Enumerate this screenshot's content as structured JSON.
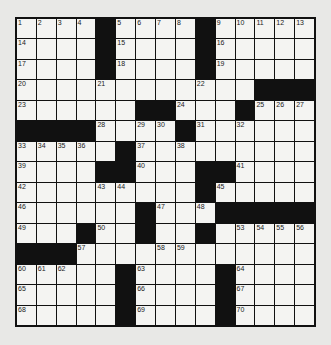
{
  "puzzle": {
    "rows": 15,
    "cols": 15,
    "colors": {
      "black": "#111111",
      "white": "#f4f4f2",
      "background": "#e8e8e6"
    },
    "grid": [
      "....#....#.....",
      "....#....#.....",
      "....#....#.....",
      "............###",
      "......##...#...",
      "####....#......",
      ".....#.........",
      "....##...##....",
      ".........#.....",
      "......#...#####",
      "...#..#..#.....",
      "###............",
      ".....#....#....",
      ".....#....#....",
      ".....#....#...."
    ],
    "numbers": [
      {
        "r": 0,
        "c": 0,
        "n": "1"
      },
      {
        "r": 0,
        "c": 1,
        "n": "2"
      },
      {
        "r": 0,
        "c": 2,
        "n": "3"
      },
      {
        "r": 0,
        "c": 3,
        "n": "4"
      },
      {
        "r": 0,
        "c": 5,
        "n": "5"
      },
      {
        "r": 0,
        "c": 6,
        "n": "6"
      },
      {
        "r": 0,
        "c": 7,
        "n": "7"
      },
      {
        "r": 0,
        "c": 8,
        "n": "8"
      },
      {
        "r": 0,
        "c": 10,
        "n": "9"
      },
      {
        "r": 0,
        "c": 11,
        "n": "10"
      },
      {
        "r": 0,
        "c": 12,
        "n": "11"
      },
      {
        "r": 0,
        "c": 13,
        "n": "12"
      },
      {
        "r": 0,
        "c": 14,
        "n": "13"
      },
      {
        "r": 1,
        "c": 0,
        "n": "14"
      },
      {
        "r": 1,
        "c": 5,
        "n": "15"
      },
      {
        "r": 1,
        "c": 10,
        "n": "16"
      },
      {
        "r": 2,
        "c": 0,
        "n": "17"
      },
      {
        "r": 2,
        "c": 5,
        "n": "18"
      },
      {
        "r": 2,
        "c": 10,
        "n": "19"
      },
      {
        "r": 3,
        "c": 0,
        "n": "20"
      },
      {
        "r": 3,
        "c": 4,
        "n": "21"
      },
      {
        "r": 3,
        "c": 9,
        "n": "22"
      },
      {
        "r": 4,
        "c": 0,
        "n": "23"
      },
      {
        "r": 4,
        "c": 8,
        "n": "24"
      },
      {
        "r": 4,
        "c": 12,
        "n": "25"
      },
      {
        "r": 4,
        "c": 13,
        "n": "26"
      },
      {
        "r": 4,
        "c": 14,
        "n": "27"
      },
      {
        "r": 5,
        "c": 4,
        "n": "28"
      },
      {
        "r": 5,
        "c": 6,
        "n": "29"
      },
      {
        "r": 5,
        "c": 7,
        "n": "30"
      },
      {
        "r": 5,
        "c": 9,
        "n": "31"
      },
      {
        "r": 5,
        "c": 11,
        "n": "32"
      },
      {
        "r": 6,
        "c": 0,
        "n": "33"
      },
      {
        "r": 6,
        "c": 1,
        "n": "34"
      },
      {
        "r": 6,
        "c": 2,
        "n": "35"
      },
      {
        "r": 6,
        "c": 3,
        "n": "36"
      },
      {
        "r": 6,
        "c": 6,
        "n": "37"
      },
      {
        "r": 6,
        "c": 8,
        "n": "38"
      },
      {
        "r": 7,
        "c": 0,
        "n": "39"
      },
      {
        "r": 7,
        "c": 6,
        "n": "40"
      },
      {
        "r": 7,
        "c": 11,
        "n": "41"
      },
      {
        "r": 8,
        "c": 0,
        "n": "42"
      },
      {
        "r": 8,
        "c": 4,
        "n": "43"
      },
      {
        "r": 8,
        "c": 5,
        "n": "44"
      },
      {
        "r": 8,
        "c": 10,
        "n": "45"
      },
      {
        "r": 9,
        "c": 0,
        "n": "46"
      },
      {
        "r": 9,
        "c": 7,
        "n": "47"
      },
      {
        "r": 9,
        "c": 9,
        "n": "48"
      },
      {
        "r": 10,
        "c": 0,
        "n": "49"
      },
      {
        "r": 10,
        "c": 4,
        "n": "50"
      },
      {
        "r": 10,
        "c": 6,
        "n": "51"
      },
      {
        "r": 10,
        "c": 9,
        "n": "52"
      },
      {
        "r": 10,
        "c": 11,
        "n": "53"
      },
      {
        "r": 10,
        "c": 12,
        "n": "54"
      },
      {
        "r": 10,
        "c": 13,
        "n": "55"
      },
      {
        "r": 10,
        "c": 14,
        "n": "56"
      },
      {
        "r": 11,
        "c": 3,
        "n": "57"
      },
      {
        "r": 11,
        "c": 7,
        "n": "58"
      },
      {
        "r": 11,
        "c": 8,
        "n": "59"
      },
      {
        "r": 12,
        "c": 0,
        "n": "60"
      },
      {
        "r": 12,
        "c": 1,
        "n": "61"
      },
      {
        "r": 12,
        "c": 2,
        "n": "62"
      },
      {
        "r": 12,
        "c": 6,
        "n": "63"
      },
      {
        "r": 12,
        "c": 11,
        "n": "64"
      },
      {
        "r": 13,
        "c": 0,
        "n": "65"
      },
      {
        "r": 13,
        "c": 6,
        "n": "66"
      },
      {
        "r": 13,
        "c": 11,
        "n": "67"
      },
      {
        "r": 14,
        "c": 0,
        "n": "68"
      },
      {
        "r": 14,
        "c": 6,
        "n": "69"
      },
      {
        "r": 14,
        "c": 11,
        "n": "70"
      }
    ]
  }
}
